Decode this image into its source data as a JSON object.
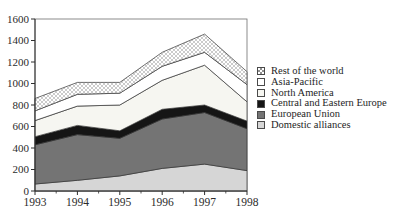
{
  "chart_data": {
    "type": "area",
    "stacked": true,
    "title": "",
    "xlabel": "",
    "ylabel": "",
    "x_labels": [
      "1993",
      "1994",
      "1995",
      "1996",
      "1997",
      "1998"
    ],
    "y_tick_labels": [
      "0",
      "200",
      "400",
      "600",
      "800",
      "1000",
      "1200",
      "1400",
      "1600"
    ],
    "ylim": [
      0,
      1600
    ],
    "ytick_step": 200,
    "grid": false,
    "legend_position": "right",
    "series": [
      {
        "name": "Domestic alliances",
        "values": [
          65,
          100,
          140,
          210,
          250,
          190
        ],
        "fill": "#d6d6d6"
      },
      {
        "name": "European Union",
        "values": [
          365,
          425,
          350,
          460,
          480,
          390
        ],
        "fill": "#747474"
      },
      {
        "name": "Central and Eastern Europe",
        "values": [
          75,
          85,
          70,
          90,
          70,
          70
        ],
        "fill": "#151515"
      },
      {
        "name": "North America",
        "values": [
          150,
          180,
          240,
          270,
          370,
          180
        ],
        "fill": "#f6f6f1"
      },
      {
        "name": "Asia-Pacific",
        "values": [
          90,
          110,
          110,
          130,
          120,
          160
        ],
        "fill": "#ffffff"
      },
      {
        "name": "Rest of the world",
        "values": [
          115,
          110,
          100,
          130,
          170,
          120
        ],
        "fill": "crosshatch"
      }
    ],
    "stacked_totals": [
      860,
      1010,
      1010,
      1290,
      1460,
      1110
    ],
    "legend_items": [
      {
        "label": "Rest of the world",
        "swatch": "crosshatch"
      },
      {
        "label": "Asia-Pacific",
        "swatch": "#ffffff"
      },
      {
        "label": "North America",
        "swatch": "#f6f6f1"
      },
      {
        "label": "Central and Eastern Europe",
        "swatch": "#151515"
      },
      {
        "label": "European Union",
        "swatch": "#747474"
      },
      {
        "label": "Domestic alliances",
        "swatch": "#d6d6d6"
      }
    ]
  },
  "colors": {
    "axis_line": "#2e2e2e",
    "frame_line": "#6f6f6f",
    "band_outline": "#343434",
    "hatch_line": "#969696",
    "tick_label": "#2b2b2b"
  }
}
